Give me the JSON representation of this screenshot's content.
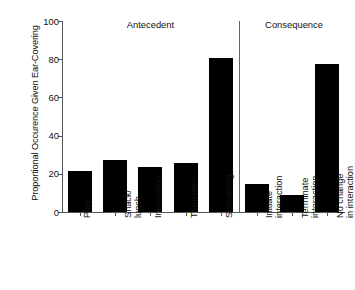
{
  "chart_data": {
    "type": "bar",
    "title": "",
    "xlabel": "",
    "ylabel": "Proportional Occurence Given Ear-Covering",
    "ylim": [
      0,
      100
    ],
    "yticks": [
      0,
      20,
      40,
      60,
      80,
      100
    ],
    "grid": false,
    "legend": false,
    "bar_color": "#000000",
    "categories": [
      "Play",
      "Snack/ lunch",
      "Instruction",
      "Transition",
      "Screaming",
      "Initiate interaction",
      "Terminate interaction",
      "No change in interaction"
    ],
    "category_lines": [
      [
        "Play"
      ],
      [
        "Snack/",
        "lunch"
      ],
      [
        "Instruction"
      ],
      [
        "Transition"
      ],
      [
        "Screaming"
      ],
      [
        "Initiate",
        "interaction"
      ],
      [
        "Terminate",
        "interaction"
      ],
      [
        "No change",
        "in interaction"
      ]
    ],
    "values": [
      21.5,
      27,
      23.5,
      25.5,
      80.5,
      14.5,
      9,
      77.5
    ],
    "groups": [
      {
        "label": "Antecedent",
        "categories": [
          "Play",
          "Snack/ lunch",
          "Instruction",
          "Transition",
          "Screaming"
        ]
      },
      {
        "label": "Consequence",
        "categories": [
          "Initiate interaction",
          "Terminate interaction",
          "No change in interaction"
        ]
      }
    ],
    "annotations": {
      "group_divider": true
    }
  },
  "axis": {
    "y_title": "Proportional Occurence Given Ear-Covering",
    "tick_0": "0",
    "tick_20": "20",
    "tick_40": "40",
    "tick_60": "60",
    "tick_80": "80",
    "tick_100": "100"
  },
  "sections": {
    "antecedent": "Antecedent",
    "consequence": "Consequence"
  },
  "labels": {
    "play": "Play",
    "snack_1": "Snack/",
    "snack_2": "lunch",
    "instruction": "Instruction",
    "transition": "Transition",
    "screaming": "Screaming",
    "initiate_1": "Initiate",
    "initiate_2": "interaction",
    "terminate_1": "Terminate",
    "terminate_2": "interaction",
    "nochange_1": "No change",
    "nochange_2": "in interaction"
  }
}
